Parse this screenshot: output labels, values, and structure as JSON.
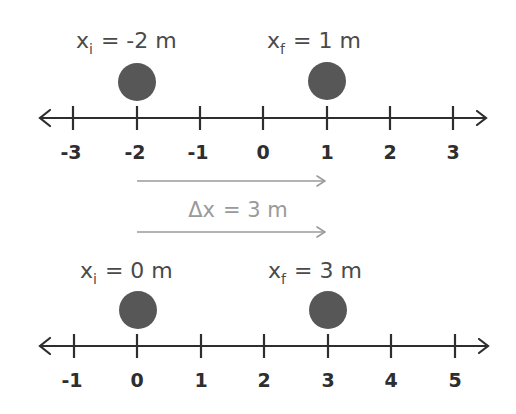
{
  "diagram": {
    "colors": {
      "axis": "#2e2e2e",
      "dot": "#575757",
      "label": "#4a4a4a",
      "displacement": "#9a9a9a"
    },
    "top_axis": {
      "ticks": [
        "-3",
        "-2",
        "-1",
        "0",
        "1",
        "2",
        "3"
      ],
      "initial": {
        "var": "x",
        "sub": "i",
        "eq": "= -2 m",
        "value": -2
      },
      "final": {
        "var": "x",
        "sub": "f",
        "eq": "= 1 m",
        "value": 1
      }
    },
    "displacement": {
      "var": "Δx",
      "eq": "= 3 m",
      "value": 3,
      "unit": "m"
    },
    "bottom_axis": {
      "ticks": [
        "-1",
        "0",
        "1",
        "2",
        "3",
        "4",
        "5"
      ],
      "initial": {
        "var": "x",
        "sub": "i",
        "eq": "= 0 m",
        "value": 0
      },
      "final": {
        "var": "x",
        "sub": "f",
        "eq": "= 3 m",
        "value": 3
      }
    }
  }
}
